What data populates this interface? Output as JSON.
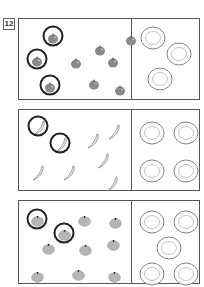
{
  "exercise": {
    "number": "12",
    "instruction_footer": ""
  },
  "colors": {
    "border": "#555555",
    "apple": "#8a8a8a",
    "orange": "#b5b5b5",
    "circle_mark": "#222222",
    "plate": "#777777"
  },
  "panels": [
    {
      "name": "apples",
      "fruit": "apple-icon",
      "fruit_count": 9,
      "plate_count": 3,
      "circled_count": 3,
      "fruits": [
        {
          "x": 28,
          "y": 11,
          "circled": true
        },
        {
          "x": 75,
          "y": 23,
          "circled": false
        },
        {
          "x": 106,
          "y": 13,
          "circled": false
        },
        {
          "x": 12,
          "y": 34,
          "circled": true
        },
        {
          "x": 51,
          "y": 36,
          "circled": false
        },
        {
          "x": 88,
          "y": 35,
          "circled": false
        },
        {
          "x": 25,
          "y": 60,
          "circled": true
        },
        {
          "x": 69,
          "y": 57,
          "circled": false
        },
        {
          "x": 95,
          "y": 63,
          "circled": false
        }
      ],
      "plates": [
        {
          "x": 21,
          "y": 9
        },
        {
          "x": 47,
          "y": 25
        },
        {
          "x": 28,
          "y": 50
        }
      ]
    },
    {
      "name": "bananas",
      "fruit": "banana-icon",
      "fruit_count": 8,
      "plate_count": 4,
      "circled_count": 2,
      "fruits": [
        {
          "x": 13,
          "y": 10,
          "circled": true
        },
        {
          "x": 35,
          "y": 27,
          "circled": true
        },
        {
          "x": 67,
          "y": 23,
          "circled": false
        },
        {
          "x": 88,
          "y": 14,
          "circled": false
        },
        {
          "x": 77,
          "y": 43,
          "circled": false
        },
        {
          "x": 12,
          "y": 55,
          "circled": false
        },
        {
          "x": 43,
          "y": 55,
          "circled": false
        },
        {
          "x": 86,
          "y": 66,
          "circled": false
        }
      ],
      "plates": [
        {
          "x": 20,
          "y": 13
        },
        {
          "x": 54,
          "y": 13
        },
        {
          "x": 20,
          "y": 51
        },
        {
          "x": 54,
          "y": 51
        }
      ]
    },
    {
      "name": "oranges",
      "fruit": "orange-icon",
      "fruit_count": 9,
      "plate_count": 5,
      "circled_count": 2,
      "fruits": [
        {
          "x": 12,
          "y": 12,
          "circled": true
        },
        {
          "x": 59,
          "y": 12,
          "circled": false
        },
        {
          "x": 90,
          "y": 14,
          "circled": false
        },
        {
          "x": 39,
          "y": 26,
          "circled": true
        },
        {
          "x": 23,
          "y": 40,
          "circled": false
        },
        {
          "x": 60,
          "y": 41,
          "circled": false
        },
        {
          "x": 88,
          "y": 36,
          "circled": false
        },
        {
          "x": 12,
          "y": 68,
          "circled": false
        },
        {
          "x": 53,
          "y": 66,
          "circled": false
        },
        {
          "x": 89,
          "y": 68,
          "circled": false
        }
      ],
      "plates": [
        {
          "x": 20,
          "y": 11
        },
        {
          "x": 54,
          "y": 11
        },
        {
          "x": 37,
          "y": 37
        },
        {
          "x": 20,
          "y": 63
        },
        {
          "x": 54,
          "y": 63
        }
      ]
    }
  ]
}
